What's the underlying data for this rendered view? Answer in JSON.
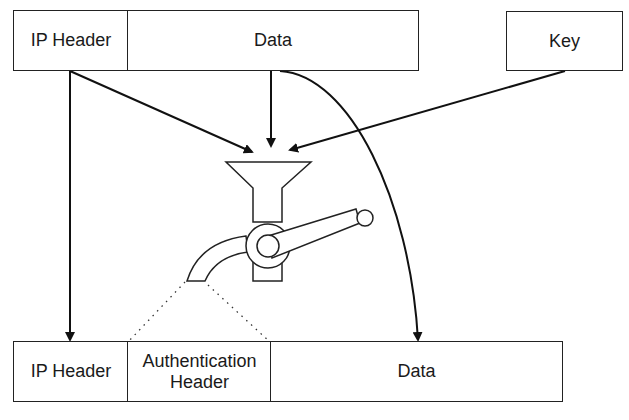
{
  "top_row": {
    "ip_header": "IP Header",
    "data": "Data",
    "key": "Key"
  },
  "bottom_row": {
    "ip_header": "IP Header",
    "auth_header_line1": "Authentication",
    "auth_header_line2": "Header",
    "data": "Data"
  },
  "colors": {
    "stroke": "#222222",
    "background": "#ffffff"
  }
}
